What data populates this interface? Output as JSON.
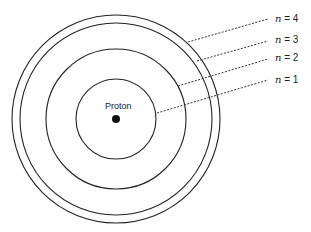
{
  "diagram": {
    "nucleus": {
      "label": "Proton",
      "cx": 116,
      "cy": 119,
      "r": 4
    },
    "orbits": [
      {
        "n": 1,
        "label_var": "n",
        "label_rest": " = 1",
        "r": 40,
        "line": [
          157,
          113,
          268,
          80
        ],
        "label_x": 275,
        "label_y": 75
      },
      {
        "n": 2,
        "label_var": "n",
        "label_rest": " = 2",
        "r": 70,
        "line": [
          178,
          86,
          268,
          59
        ],
        "label_x": 275,
        "label_y": 53
      },
      {
        "n": 3,
        "label_var": "n",
        "label_rest": " = 3",
        "r": 96,
        "line": [
          197,
          61,
          268,
          41
        ],
        "label_x": 275,
        "label_y": 35
      },
      {
        "n": 4,
        "label_var": "n",
        "label_rest": " = 4",
        "r": 104,
        "line": [
          188,
          42,
          268,
          19
        ],
        "label_x": 275,
        "label_y": 14
      }
    ],
    "colors": {
      "stroke": "#222222",
      "background": "#fefefe"
    }
  }
}
